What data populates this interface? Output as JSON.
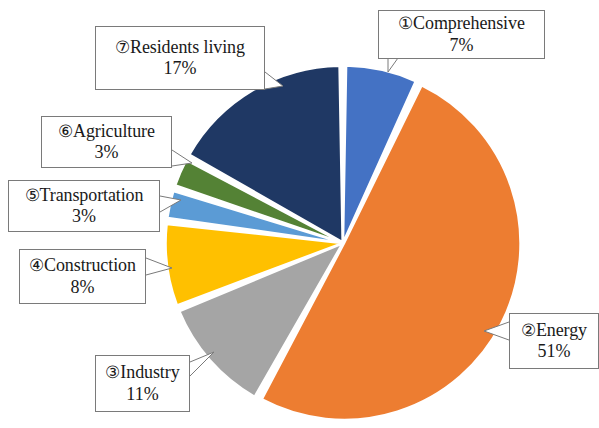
{
  "chart_data": {
    "type": "pie",
    "title": "",
    "subtitle": "",
    "xlabel": "",
    "ylabel": "",
    "legend_position": "callout-labels",
    "grid": false,
    "unit": "%",
    "start_angle_deg": 0,
    "direction": "clockwise",
    "categories": [
      "Comprehensive",
      "Energy",
      "Industry",
      "Construction",
      "Transportation",
      "Agriculture",
      "Residents living"
    ],
    "values": [
      7,
      51,
      11,
      8,
      3,
      3,
      17
    ],
    "colors": [
      "#4472C4",
      "#ED7D31",
      "#A5A5A5",
      "#FFC000",
      "#5B9BD5",
      "#548235",
      "#1F3864"
    ],
    "slices": [
      {
        "index": 1,
        "marker": "①",
        "label": "Comprehensive",
        "value": 7,
        "value_text": "7%",
        "color": "#4472C4",
        "start_deg": 0,
        "end_deg": 25.2
      },
      {
        "index": 2,
        "marker": "②",
        "label": "Energy",
        "value": 51,
        "value_text": "51%",
        "color": "#ED7D31",
        "start_deg": 25.2,
        "end_deg": 208.8
      },
      {
        "index": 3,
        "marker": "③",
        "label": "Industry",
        "value": 11,
        "value_text": "11%",
        "color": "#A5A5A5",
        "start_deg": 208.8,
        "end_deg": 248.4
      },
      {
        "index": 4,
        "marker": "④",
        "label": "Construction",
        "value": 8,
        "value_text": "8%",
        "color": "#FFC000",
        "start_deg": 248.4,
        "end_deg": 277.2
      },
      {
        "index": 5,
        "marker": "⑤",
        "label": "Transportation",
        "value": 3,
        "value_text": "3%",
        "color": "#5B9BD5",
        "start_deg": 277.2,
        "end_deg": 288.0
      },
      {
        "index": 6,
        "marker": "⑥",
        "label": "Agriculture",
        "value": 3,
        "value_text": "3%",
        "color": "#548235",
        "start_deg": 288.0,
        "end_deg": 298.8
      },
      {
        "index": 7,
        "marker": "⑦",
        "label": "Residents living",
        "value": 17,
        "value_text": "17%",
        "color": "#1F3864",
        "start_deg": 298.8,
        "end_deg": 360.0
      }
    ]
  },
  "callouts": {
    "comprehensive": {
      "marker": "①",
      "label": "Comprehensive",
      "value_text": "7%"
    },
    "energy": {
      "marker": "②",
      "label": "Energy",
      "value_text": "51%"
    },
    "industry": {
      "marker": "③",
      "label": "Industry",
      "value_text": "11%"
    },
    "construction": {
      "marker": "④",
      "label": "Construction",
      "value_text": "8%"
    },
    "transportation": {
      "marker": "⑤",
      "label": "Transportation",
      "value_text": "3%"
    },
    "agriculture": {
      "marker": "⑥",
      "label": "Agriculture",
      "value_text": "3%"
    },
    "residents_living": {
      "marker": "⑦",
      "label": "Residents living",
      "value_text": "17%"
    }
  }
}
